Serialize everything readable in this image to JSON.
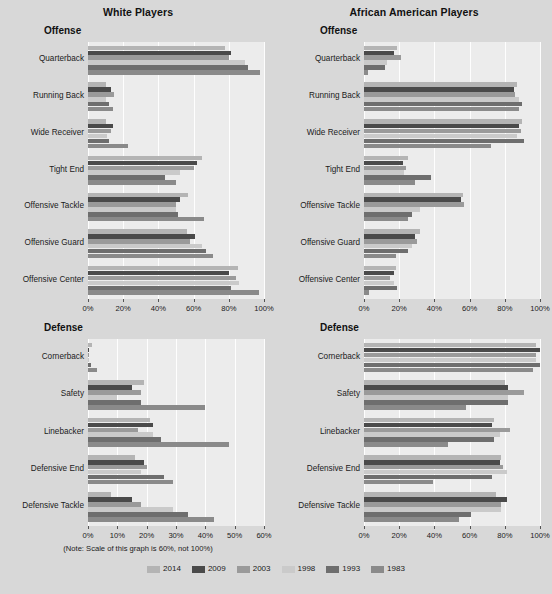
{
  "figure": {
    "background": "#d8d8d8",
    "note": "(Note: Scale of this graph is 60%, not 100%)",
    "footer": ""
  },
  "legend": {
    "position": "bottom-center",
    "entries": [
      {
        "label": "2014",
        "color": "#b4b4b4"
      },
      {
        "label": "2009",
        "color": "#4a4a4a"
      },
      {
        "label": "2003",
        "color": "#9a9a9a"
      },
      {
        "label": "1998",
        "color": "#cacaca"
      },
      {
        "label": "1993",
        "color": "#6e6e6e"
      },
      {
        "label": "1983",
        "color": "#8a8a8a"
      }
    ]
  },
  "panels": {
    "top_left": {
      "title": "White Players",
      "section": "Offense"
    },
    "top_right": {
      "title": "African American Players",
      "section": "Offense"
    },
    "bottom_left": {
      "title": "",
      "section": "Defense"
    },
    "bottom_right": {
      "title": "",
      "section": "Defense"
    }
  },
  "chart_data": [
    {
      "id": "offense-white",
      "type": "bar",
      "orientation": "horizontal",
      "title": "White Players",
      "subtitle": "Offense",
      "xlabel": "",
      "ylabel": "",
      "xlim": [
        0,
        100
      ],
      "xticks": [
        0,
        20,
        40,
        60,
        80,
        100
      ],
      "xtick_labels": [
        "0%",
        "20%",
        "40%",
        "60%",
        "80%",
        "100%"
      ],
      "grid": true,
      "categories": [
        "Quarterback",
        "Running Back",
        "Wide Receiver",
        "Tight End",
        "Offensive Tackle",
        "Offensive Guard",
        "Offensive Center"
      ],
      "series": [
        {
          "name": "2014",
          "color": "#b4b4b4",
          "values": [
            78,
            10,
            10,
            65,
            57,
            56,
            85
          ]
        },
        {
          "name": "2009",
          "color": "#4a4a4a",
          "values": [
            81,
            13,
            14,
            62,
            52,
            61,
            80
          ]
        },
        {
          "name": "2003",
          "color": "#9a9a9a",
          "values": [
            80,
            15,
            13,
            60,
            50,
            58,
            84
          ]
        },
        {
          "name": "1998",
          "color": "#cacaca",
          "values": [
            89,
            10,
            11,
            52,
            50,
            65,
            86
          ]
        },
        {
          "name": "1993",
          "color": "#6e6e6e",
          "values": [
            91,
            12,
            12,
            44,
            51,
            67,
            81
          ]
        },
        {
          "name": "1983",
          "color": "#8a8a8a",
          "values": [
            98,
            14,
            23,
            50,
            66,
            71,
            97
          ]
        }
      ]
    },
    {
      "id": "offense-african-american",
      "type": "bar",
      "orientation": "horizontal",
      "title": "African American Players",
      "subtitle": "Offense",
      "xlabel": "",
      "ylabel": "",
      "xlim": [
        0,
        100
      ],
      "xticks": [
        0,
        20,
        40,
        60,
        80,
        100
      ],
      "xtick_labels": [
        "0%",
        "20%",
        "40%",
        "60%",
        "80%",
        "100%"
      ],
      "grid": true,
      "categories": [
        "Quarterback",
        "Running Back",
        "Wide Receiver",
        "Tight End",
        "Offensive Tackle",
        "Offensive Guard",
        "Offensive Center"
      ],
      "series": [
        {
          "name": "2014",
          "color": "#b4b4b4",
          "values": [
            19,
            87,
            90,
            25,
            56,
            32,
            18
          ]
        },
        {
          "name": "2009",
          "color": "#4a4a4a",
          "values": [
            17,
            85,
            88,
            22,
            55,
            29,
            17
          ]
        },
        {
          "name": "2003",
          "color": "#9a9a9a",
          "values": [
            21,
            86,
            89,
            24,
            57,
            30,
            15
          ]
        },
        {
          "name": "1998",
          "color": "#cacaca",
          "values": [
            13,
            88,
            87,
            23,
            32,
            27,
            17
          ]
        },
        {
          "name": "1993",
          "color": "#6e6e6e",
          "values": [
            12,
            90,
            91,
            38,
            27,
            25,
            19
          ]
        },
        {
          "name": "1983",
          "color": "#8a8a8a",
          "values": [
            2,
            88,
            72,
            29,
            25,
            18,
            3
          ]
        }
      ]
    },
    {
      "id": "defense-white",
      "type": "bar",
      "orientation": "horizontal",
      "title": "",
      "subtitle": "Defense",
      "xlabel": "",
      "ylabel": "",
      "xlim": [
        0,
        60
      ],
      "xticks": [
        0,
        10,
        20,
        30,
        40,
        50,
        60
      ],
      "xtick_labels": [
        "0%",
        "10%",
        "20%",
        "30%",
        "40%",
        "50%",
        "60%"
      ],
      "grid": true,
      "note": "(Note: Scale of this graph is 60%, not 100%)",
      "categories": [
        "Cornerback",
        "Safety",
        "Linebacker",
        "Defensive End",
        "Defensive Tackle"
      ],
      "series": [
        {
          "name": "2014",
          "color": "#b4b4b4",
          "values": [
            1.5,
            19,
            21,
            16,
            8
          ]
        },
        {
          "name": "2009",
          "color": "#4a4a4a",
          "values": [
            0.5,
            15,
            22,
            19,
            15
          ]
        },
        {
          "name": "2003",
          "color": "#9a9a9a",
          "values": [
            0.3,
            18,
            17,
            20,
            18
          ]
        },
        {
          "name": "1998",
          "color": "#cacaca",
          "values": [
            0.5,
            10,
            22,
            18,
            29
          ]
        },
        {
          "name": "1993",
          "color": "#6e6e6e",
          "values": [
            1.0,
            18,
            25,
            26,
            34
          ]
        },
        {
          "name": "1983",
          "color": "#8a8a8a",
          "values": [
            3.0,
            40,
            48,
            29,
            43
          ]
        }
      ]
    },
    {
      "id": "defense-african-american",
      "type": "bar",
      "orientation": "horizontal",
      "title": "",
      "subtitle": "Defense",
      "xlabel": "",
      "ylabel": "",
      "xlim": [
        0,
        100
      ],
      "xticks": [
        0,
        20,
        40,
        60,
        80,
        100
      ],
      "xtick_labels": [
        "0%",
        "20%",
        "40%",
        "60%",
        "80%",
        "100%"
      ],
      "grid": true,
      "categories": [
        "Cornerback",
        "Safety",
        "Linebacker",
        "Defensive End",
        "Defensive Tackle"
      ],
      "series": [
        {
          "name": "2014",
          "color": "#b4b4b4",
          "values": [
            98,
            80,
            74,
            78,
            75
          ]
        },
        {
          "name": "2009",
          "color": "#4a4a4a",
          "values": [
            100,
            82,
            73,
            77,
            81
          ]
        },
        {
          "name": "2003",
          "color": "#9a9a9a",
          "values": [
            98,
            91,
            83,
            79,
            78
          ]
        },
        {
          "name": "1998",
          "color": "#cacaca",
          "values": [
            98,
            82,
            77,
            81,
            78
          ]
        },
        {
          "name": "1993",
          "color": "#6e6e6e",
          "values": [
            100,
            82,
            74,
            73,
            61
          ]
        },
        {
          "name": "1983",
          "color": "#8a8a8a",
          "values": [
            96,
            58,
            48,
            39,
            54
          ]
        }
      ]
    }
  ]
}
